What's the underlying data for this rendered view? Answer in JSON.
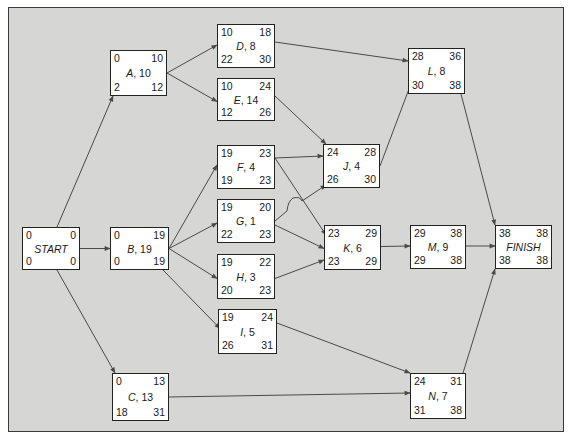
{
  "diagram": {
    "type": "activity-on-node network (critical path)",
    "node_fields": [
      "earliest_start",
      "earliest_finish",
      "latest_start",
      "latest_finish"
    ],
    "colors": {
      "background": "#d6d6d4",
      "node_fill": "#ffffff",
      "line": "#3a3a3a"
    },
    "nodes": {
      "START": {
        "name": "START",
        "duration": "",
        "label": "START",
        "es": "0",
        "ef": "0",
        "ls": "0",
        "lf": "0"
      },
      "A": {
        "name": "A",
        "duration": "10",
        "label": "A, 10",
        "es": "0",
        "ef": "10",
        "ls": "2",
        "lf": "12"
      },
      "B": {
        "name": "B",
        "duration": "19",
        "label": "B, 19",
        "es": "0",
        "ef": "19",
        "ls": "0",
        "lf": "19"
      },
      "C": {
        "name": "C",
        "duration": "13",
        "label": "C, 13",
        "es": "0",
        "ef": "13",
        "ls": "18",
        "lf": "31"
      },
      "D": {
        "name": "D",
        "duration": "8",
        "label": "D, 8",
        "es": "10",
        "ef": "18",
        "ls": "22",
        "lf": "30"
      },
      "E": {
        "name": "E",
        "duration": "14",
        "label": "E, 14",
        "es": "10",
        "ef": "24",
        "ls": "12",
        "lf": "26"
      },
      "F": {
        "name": "F",
        "duration": "4",
        "label": "F, 4",
        "es": "19",
        "ef": "23",
        "ls": "19",
        "lf": "23"
      },
      "G": {
        "name": "G",
        "duration": "1",
        "label": "G, 1",
        "es": "19",
        "ef": "20",
        "ls": "22",
        "lf": "23"
      },
      "H": {
        "name": "H",
        "duration": "3",
        "label": "H, 3",
        "es": "19",
        "ef": "22",
        "ls": "20",
        "lf": "23"
      },
      "I": {
        "name": "I",
        "duration": "5",
        "label": "I, 5",
        "es": "19",
        "ef": "24",
        "ls": "26",
        "lf": "31"
      },
      "J": {
        "name": "J",
        "duration": "4",
        "label": "J, 4",
        "es": "24",
        "ef": "28",
        "ls": "26",
        "lf": "30"
      },
      "K": {
        "name": "K",
        "duration": "6",
        "label": "K, 6",
        "es": "23",
        "ef": "29",
        "ls": "23",
        "lf": "29"
      },
      "L": {
        "name": "L",
        "duration": "8",
        "label": "L, 8",
        "es": "28",
        "ef": "36",
        "ls": "30",
        "lf": "38"
      },
      "M": {
        "name": "M",
        "duration": "9",
        "label": "M, 9",
        "es": "29",
        "ef": "38",
        "ls": "29",
        "lf": "38"
      },
      "N": {
        "name": "N",
        "duration": "7",
        "label": "N, 7",
        "es": "24",
        "ef": "31",
        "ls": "31",
        "lf": "38"
      },
      "FINISH": {
        "name": "FINISH",
        "duration": "",
        "label": "FINISH",
        "es": "38",
        "ef": "38",
        "ls": "38",
        "lf": "38"
      }
    },
    "edges": [
      [
        "START",
        "A"
      ],
      [
        "START",
        "B"
      ],
      [
        "START",
        "C"
      ],
      [
        "A",
        "D"
      ],
      [
        "A",
        "E"
      ],
      [
        "B",
        "F"
      ],
      [
        "B",
        "G"
      ],
      [
        "B",
        "H"
      ],
      [
        "B",
        "I"
      ],
      [
        "D",
        "L"
      ],
      [
        "E",
        "J"
      ],
      [
        "F",
        "J"
      ],
      [
        "F",
        "K"
      ],
      [
        "G",
        "J"
      ],
      [
        "G",
        "K"
      ],
      [
        "H",
        "K"
      ],
      [
        "I",
        "N"
      ],
      [
        "J",
        "L"
      ],
      [
        "K",
        "M"
      ],
      [
        "C",
        "N"
      ],
      [
        "L",
        "FINISH"
      ],
      [
        "M",
        "FINISH"
      ],
      [
        "N",
        "FINISH"
      ]
    ]
  }
}
